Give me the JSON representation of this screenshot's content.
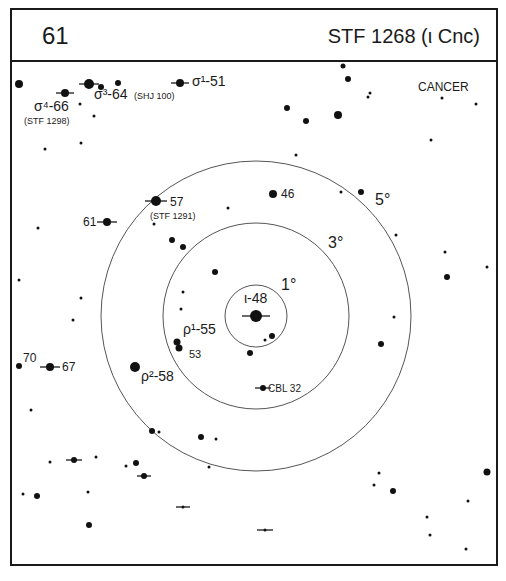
{
  "header": {
    "chart_number": "61",
    "title": "STF 1268 (ι Cnc)"
  },
  "constellation_label": "CANCER",
  "chart_data": {
    "type": "scatter",
    "title": "STF 1268 (ι Cnc)",
    "chart_number": "61",
    "constellation": "CANCER",
    "center": {
      "name": "ι-48",
      "x": 256,
      "y": 316
    },
    "rings": [
      {
        "label": "1°",
        "r": 31,
        "label_x": 281,
        "label_y": 290
      },
      {
        "label": "3°",
        "r": 93,
        "label_x": 328,
        "label_y": 248
      },
      {
        "label": "5°",
        "r": 155,
        "label_x": 375,
        "label_y": 205
      }
    ],
    "labels": [
      {
        "text": "ι-48",
        "x": 244,
        "y": 303,
        "size": 14
      },
      {
        "text": "σ¹-51",
        "x": 192,
        "y": 86,
        "size": 14
      },
      {
        "text": "σ³-64",
        "x": 94,
        "y": 99,
        "size": 14
      },
      {
        "text": "(SHJ 100)",
        "x": 134,
        "y": 99,
        "size": 9
      },
      {
        "text": "σ⁴-66",
        "x": 34,
        "y": 111,
        "size": 14
      },
      {
        "text": "(STF 1298)",
        "x": 24,
        "y": 124,
        "size": 9
      },
      {
        "text": "57",
        "x": 170,
        "y": 206,
        "size": 12
      },
      {
        "text": "(STF 1291)",
        "x": 150,
        "y": 219,
        "size": 9
      },
      {
        "text": "61",
        "x": 83,
        "y": 226,
        "size": 12
      },
      {
        "text": "46",
        "x": 281,
        "y": 198,
        "size": 12
      },
      {
        "text": "ρ¹-55",
        "x": 183,
        "y": 334,
        "size": 14
      },
      {
        "text": "53",
        "x": 189,
        "y": 358,
        "size": 11
      },
      {
        "text": "ρ²-58",
        "x": 141,
        "y": 381,
        "size": 14
      },
      {
        "text": "70",
        "x": 23,
        "y": 362,
        "size": 12
      },
      {
        "text": "67",
        "x": 62,
        "y": 371,
        "size": 12
      },
      {
        "text": "CBL 32",
        "x": 268,
        "y": 392,
        "size": 10
      }
    ],
    "stars": [
      {
        "x": 256,
        "y": 316,
        "r": 6,
        "bar": 14
      },
      {
        "x": 19,
        "y": 84,
        "r": 4
      },
      {
        "x": 65,
        "y": 93,
        "r": 4,
        "bar": 9
      },
      {
        "x": 89,
        "y": 84,
        "r": 5,
        "bar": 10
      },
      {
        "x": 101,
        "y": 87,
        "r": 3
      },
      {
        "x": 118,
        "y": 83,
        "r": 3
      },
      {
        "x": 180,
        "y": 83,
        "r": 4,
        "bar": 9
      },
      {
        "x": 80,
        "y": 104,
        "r": 1.5
      },
      {
        "x": 94,
        "y": 116,
        "r": 1.5
      },
      {
        "x": 45,
        "y": 149,
        "r": 1.5
      },
      {
        "x": 81,
        "y": 143,
        "r": 1.5
      },
      {
        "x": 343,
        "y": 66,
        "r": 2.5
      },
      {
        "x": 348,
        "y": 79,
        "r": 3
      },
      {
        "x": 370,
        "y": 93,
        "r": 1.5
      },
      {
        "x": 368,
        "y": 97,
        "r": 1.5
      },
      {
        "x": 442,
        "y": 98,
        "r": 1.5
      },
      {
        "x": 476,
        "y": 104,
        "r": 1.5
      },
      {
        "x": 287,
        "y": 108,
        "r": 3
      },
      {
        "x": 306,
        "y": 121,
        "r": 3
      },
      {
        "x": 338,
        "y": 115,
        "r": 4
      },
      {
        "x": 431,
        "y": 140,
        "r": 1.5
      },
      {
        "x": 296,
        "y": 155,
        "r": 1.5
      },
      {
        "x": 156,
        "y": 201,
        "r": 5,
        "bar": 11
      },
      {
        "x": 107,
        "y": 222,
        "r": 4,
        "bar": 10
      },
      {
        "x": 38,
        "y": 228,
        "r": 1.5
      },
      {
        "x": 154,
        "y": 224,
        "r": 1.5
      },
      {
        "x": 228,
        "y": 208,
        "r": 1.5
      },
      {
        "x": 273,
        "y": 194,
        "r": 4
      },
      {
        "x": 341,
        "y": 192,
        "r": 1.5
      },
      {
        "x": 361,
        "y": 192,
        "r": 3
      },
      {
        "x": 396,
        "y": 235,
        "r": 1.5
      },
      {
        "x": 172,
        "y": 240,
        "r": 3
      },
      {
        "x": 183,
        "y": 247,
        "r": 3
      },
      {
        "x": 445,
        "y": 252,
        "r": 1.5
      },
      {
        "x": 487,
        "y": 267,
        "r": 1.5
      },
      {
        "x": 215,
        "y": 272,
        "r": 3
      },
      {
        "x": 447,
        "y": 277,
        "r": 3
      },
      {
        "x": 19,
        "y": 280,
        "r": 1.5
      },
      {
        "x": 81,
        "y": 298,
        "r": 1.5
      },
      {
        "x": 183,
        "y": 292,
        "r": 1.5
      },
      {
        "x": 181,
        "y": 309,
        "r": 1.5
      },
      {
        "x": 73,
        "y": 320,
        "r": 1.5
      },
      {
        "x": 394,
        "y": 317,
        "r": 1.5
      },
      {
        "x": 272,
        "y": 336,
        "r": 3
      },
      {
        "x": 265,
        "y": 340,
        "r": 1.5
      },
      {
        "x": 381,
        "y": 344,
        "r": 3
      },
      {
        "x": 177,
        "y": 342,
        "r": 3.5
      },
      {
        "x": 179,
        "y": 348,
        "r": 3.5
      },
      {
        "x": 250,
        "y": 353,
        "r": 3
      },
      {
        "x": 19,
        "y": 366,
        "r": 3
      },
      {
        "x": 50,
        "y": 367,
        "r": 4,
        "bar": 10
      },
      {
        "x": 135,
        "y": 367,
        "r": 5
      },
      {
        "x": 263,
        "y": 388,
        "r": 3,
        "bar": 8
      },
      {
        "x": 31,
        "y": 410,
        "r": 1.5
      },
      {
        "x": 152,
        "y": 431,
        "r": 3
      },
      {
        "x": 159,
        "y": 432,
        "r": 1.5
      },
      {
        "x": 201,
        "y": 437,
        "r": 3
      },
      {
        "x": 216,
        "y": 439,
        "r": 1.5
      },
      {
        "x": 50,
        "y": 462,
        "r": 1.5
      },
      {
        "x": 74,
        "y": 460,
        "r": 3,
        "bar": 8
      },
      {
        "x": 96,
        "y": 457,
        "r": 1.5
      },
      {
        "x": 126,
        "y": 466,
        "r": 1.5
      },
      {
        "x": 136,
        "y": 463,
        "r": 3
      },
      {
        "x": 144,
        "y": 476,
        "r": 3,
        "bar": 7
      },
      {
        "x": 209,
        "y": 467,
        "r": 1.5
      },
      {
        "x": 379,
        "y": 473,
        "r": 1.5
      },
      {
        "x": 374,
        "y": 485,
        "r": 1.5
      },
      {
        "x": 393,
        "y": 491,
        "r": 3
      },
      {
        "x": 487,
        "y": 472,
        "r": 3.5
      },
      {
        "x": 468,
        "y": 501,
        "r": 1.5
      },
      {
        "x": 23,
        "y": 494,
        "r": 1.5
      },
      {
        "x": 37,
        "y": 496,
        "r": 3
      },
      {
        "x": 88,
        "y": 492,
        "r": 1.5
      },
      {
        "x": 183,
        "y": 507,
        "r": 1.5,
        "bar": 7
      },
      {
        "x": 427,
        "y": 517,
        "r": 1.5
      },
      {
        "x": 430,
        "y": 535,
        "r": 1.5
      },
      {
        "x": 89,
        "y": 525,
        "r": 3
      },
      {
        "x": 265,
        "y": 530,
        "r": 1.5,
        "bar": 8
      },
      {
        "x": 466,
        "y": 549,
        "r": 1.5
      }
    ],
    "xlabel": "",
    "ylabel": ""
  }
}
